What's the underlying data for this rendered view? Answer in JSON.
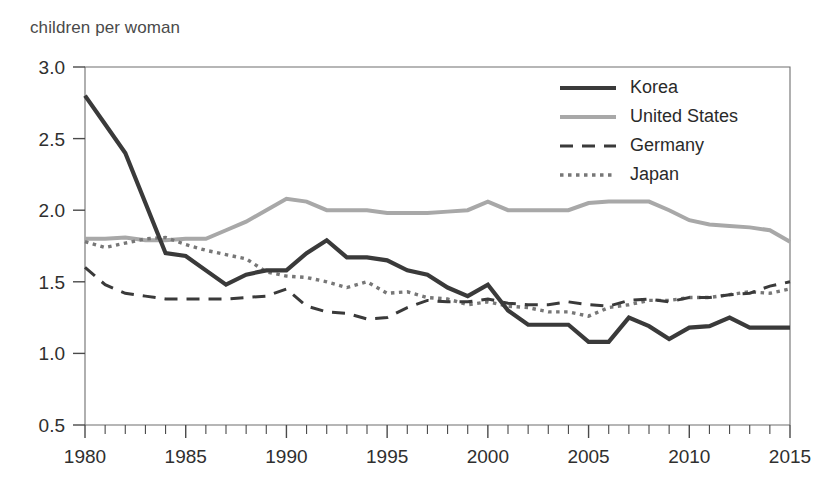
{
  "axis_title": "children per woman",
  "chart_data": {
    "type": "line",
    "title": "",
    "subtitle": "",
    "xlabel": "",
    "ylabel": "children per woman",
    "xlim": [
      1980,
      2015
    ],
    "ylim": [
      0.5,
      3.0
    ],
    "grid": false,
    "legend_position": "top-right",
    "y_ticks": [
      "3.0",
      "2.5",
      "2.0",
      "1.5",
      "1.0",
      "0.5"
    ],
    "y_tick_values": [
      3.0,
      2.5,
      2.0,
      1.5,
      1.0,
      0.5
    ],
    "x_ticks": [
      "1980",
      "1985",
      "1990",
      "1995",
      "2000",
      "2005",
      "2010",
      "2015"
    ],
    "x_tick_values": [
      1980,
      1985,
      1990,
      1995,
      2000,
      2005,
      2010,
      2015
    ],
    "x_minor_step": 1,
    "x": [
      1980,
      1981,
      1982,
      1983,
      1984,
      1985,
      1986,
      1987,
      1988,
      1989,
      1990,
      1991,
      1992,
      1993,
      1994,
      1995,
      1996,
      1997,
      1998,
      1999,
      2000,
      2001,
      2002,
      2003,
      2004,
      2005,
      2006,
      2007,
      2008,
      2009,
      2010,
      2011,
      2012,
      2013,
      2014,
      2015
    ],
    "series": [
      {
        "name": "Korea",
        "color": "#3a3a3a",
        "width": 4.2,
        "dash": "none",
        "values": [
          2.8,
          2.6,
          2.4,
          2.05,
          1.7,
          1.68,
          1.58,
          1.48,
          1.55,
          1.58,
          1.58,
          1.7,
          1.79,
          1.67,
          1.67,
          1.65,
          1.58,
          1.55,
          1.46,
          1.4,
          1.48,
          1.3,
          1.2,
          1.2,
          1.2,
          1.08,
          1.08,
          1.25,
          1.19,
          1.1,
          1.18,
          1.19,
          1.25,
          1.18,
          1.18,
          1.18
        ]
      },
      {
        "name": "United States",
        "color": "#a8a8a8",
        "width": 4.0,
        "dash": "none",
        "values": [
          1.8,
          1.8,
          1.81,
          1.79,
          1.79,
          1.8,
          1.8,
          1.86,
          1.92,
          2.0,
          2.08,
          2.06,
          2.0,
          2.0,
          2.0,
          1.98,
          1.98,
          1.98,
          1.99,
          2.0,
          2.06,
          2.0,
          2.0,
          2.0,
          2.0,
          2.05,
          2.06,
          2.06,
          2.06,
          2.0,
          1.93,
          1.9,
          1.89,
          1.88,
          1.86,
          1.78
        ]
      },
      {
        "name": "Germany",
        "color": "#3a3a3a",
        "width": 3.0,
        "dash": "13,9",
        "values": [
          1.6,
          1.48,
          1.42,
          1.4,
          1.38,
          1.38,
          1.38,
          1.38,
          1.39,
          1.4,
          1.45,
          1.33,
          1.29,
          1.28,
          1.24,
          1.25,
          1.32,
          1.37,
          1.36,
          1.36,
          1.38,
          1.35,
          1.34,
          1.34,
          1.36,
          1.34,
          1.33,
          1.37,
          1.38,
          1.36,
          1.39,
          1.39,
          1.41,
          1.42,
          1.47,
          1.5
        ]
      },
      {
        "name": "Japan",
        "color": "#777777",
        "width": 3.4,
        "dash": "3.5,4.5",
        "values": [
          1.78,
          1.74,
          1.77,
          1.8,
          1.81,
          1.76,
          1.72,
          1.69,
          1.66,
          1.57,
          1.54,
          1.53,
          1.5,
          1.46,
          1.5,
          1.42,
          1.43,
          1.39,
          1.38,
          1.34,
          1.36,
          1.33,
          1.32,
          1.29,
          1.29,
          1.26,
          1.32,
          1.34,
          1.37,
          1.37,
          1.39,
          1.39,
          1.41,
          1.43,
          1.42,
          1.45
        ]
      }
    ]
  },
  "legend": {
    "items": [
      {
        "label": "Korea",
        "swatch": "solid-thick-dark"
      },
      {
        "label": "United States",
        "swatch": "solid-light-gray"
      },
      {
        "label": "Germany",
        "swatch": "dashed-dark"
      },
      {
        "label": "Japan",
        "swatch": "dotted-gray"
      }
    ]
  }
}
